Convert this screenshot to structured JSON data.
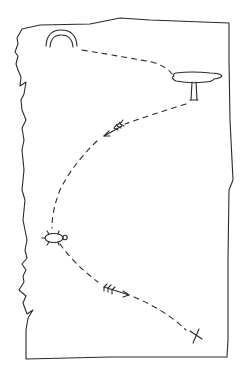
{
  "canvas": {
    "width": 243,
    "height": 372,
    "background": "#ffffff",
    "ink": "#2a2a2a"
  },
  "map": {
    "paper": {
      "description": "sheet of paper with torn left edge"
    },
    "landmarks": [
      {
        "id": "rainbow",
        "icon": "rainbow-arch-icon",
        "position": [
          62,
          42
        ]
      },
      {
        "id": "tree",
        "icon": "flat-top-tree-icon",
        "position": [
          198,
          88
        ]
      },
      {
        "id": "arrow-1",
        "icon": "arrow-icon",
        "direction": "down-left",
        "position": [
          112,
          128
        ]
      },
      {
        "id": "turtle",
        "icon": "turtle-icon",
        "position": [
          54,
          238
        ]
      },
      {
        "id": "arrow-2",
        "icon": "arrow-icon",
        "direction": "right",
        "position": [
          118,
          294
        ]
      },
      {
        "id": "treasure",
        "icon": "x-mark-icon",
        "position": [
          196,
          336
        ]
      }
    ],
    "path": [
      "rainbow",
      "tree",
      "arrow-1",
      "turtle",
      "arrow-2",
      "treasure"
    ]
  }
}
